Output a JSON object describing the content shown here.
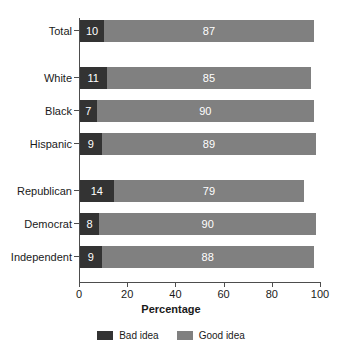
{
  "chart_data": {
    "type": "bar",
    "orientation": "horizontal",
    "stacked": true,
    "title": "",
    "xlabel": "Percentage",
    "ylabel": "",
    "xlim": [
      0,
      100
    ],
    "xticks": [
      0,
      20,
      40,
      60,
      80,
      100
    ],
    "grid": false,
    "legend_position": "bottom",
    "categories": [
      "Total",
      "White",
      "Black",
      "Hispanic",
      "Republican",
      "Democrat",
      "Independent"
    ],
    "group_breaks_after": [
      "Total",
      "Hispanic"
    ],
    "series": [
      {
        "name": "Bad idea",
        "color": "#333333",
        "values": [
          10,
          11,
          7,
          9,
          14,
          8,
          9
        ]
      },
      {
        "name": "Good idea",
        "color": "#808080",
        "values": [
          87,
          85,
          90,
          89,
          79,
          90,
          88
        ]
      }
    ]
  },
  "axis": {
    "x_title": "Percentage",
    "tick_labels": [
      "0",
      "20",
      "40",
      "60",
      "80",
      "100"
    ]
  },
  "legend": {
    "items": [
      {
        "label": "Bad idea",
        "color": "#333333"
      },
      {
        "label": "Good idea",
        "color": "#808080"
      }
    ]
  },
  "title_sliver": "",
  "colors": {
    "bad_idea": "#333333",
    "good_idea": "#808080",
    "axis": "#4d4d4d",
    "background": "#ffffff",
    "text": "#1a1a1a"
  }
}
